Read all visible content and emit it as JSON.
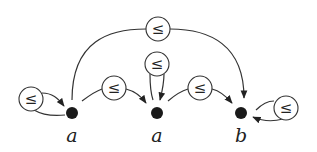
{
  "diagram": {
    "type": "directed-graph",
    "nodes": [
      {
        "id": "n1",
        "label": "a",
        "x": 72,
        "y": 113
      },
      {
        "id": "n2",
        "label": "a",
        "x": 157,
        "y": 113
      },
      {
        "id": "n3",
        "label": "b",
        "x": 241,
        "y": 113
      }
    ],
    "edges": [
      {
        "from": "n1",
        "to": "n1",
        "label": "≤",
        "kind": "self-loop-left"
      },
      {
        "from": "n1",
        "to": "n2",
        "label": "≤"
      },
      {
        "from": "n1",
        "to": "n3",
        "label": "≤",
        "kind": "arc-over"
      },
      {
        "from": "n2",
        "to": "n2",
        "label": "≤",
        "kind": "self-loop-top"
      },
      {
        "from": "n2",
        "to": "n3",
        "label": "≤"
      },
      {
        "from": "n3",
        "to": "n3",
        "label": "≤",
        "kind": "self-loop-right"
      }
    ],
    "colors": {
      "node": "#1a1a1a",
      "edge": "#333333",
      "background": "#ffffff"
    }
  }
}
